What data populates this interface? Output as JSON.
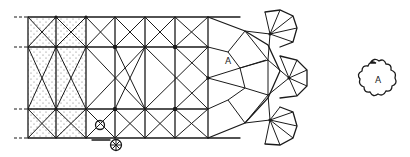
{
  "diagram": {
    "type": "architectural-floor-plan",
    "labels": {
      "vault_marker": "A",
      "detail_marker": "A"
    },
    "grid": {
      "columns_x": [
        28,
        56,
        86,
        115,
        145,
        175,
        208
      ],
      "rows_y": [
        17,
        47,
        109,
        138
      ]
    },
    "hatched_bays": "aisle bays columns 1-2",
    "features": [
      "stippled side-aisle bays",
      "sexpartite/quadripartite rib vaults",
      "radiating apse chapels",
      "circular pier",
      "spiral stair",
      "quatrefoil-like detail A"
    ],
    "colors": {
      "ink": "#1a1a1a",
      "paper": "#ffffff"
    }
  }
}
